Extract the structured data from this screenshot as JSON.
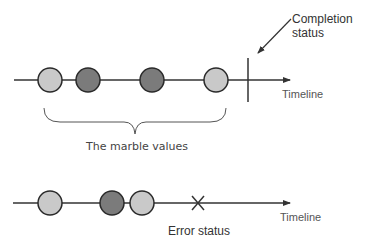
{
  "diagram": {
    "colors": {
      "line": "#333333",
      "marble_light": "#c9c9c9",
      "marble_dark": "#7b7b7b",
      "marble_stroke": "#2a2a2a"
    },
    "top_timeline": {
      "label": "Timeline",
      "marbles": [
        {
          "x": 50,
          "shade": "light"
        },
        {
          "x": 88,
          "shade": "dark"
        },
        {
          "x": 152,
          "shade": "dark"
        },
        {
          "x": 216,
          "shade": "light"
        }
      ],
      "terminator": "completion",
      "completion_label_line1": "Completion",
      "completion_label_line2": "status",
      "brace_label": "The marble values"
    },
    "bottom_timeline": {
      "label": "Timeline",
      "marbles": [
        {
          "x": 50,
          "shade": "light"
        },
        {
          "x": 112,
          "shade": "dark"
        },
        {
          "x": 142,
          "shade": "light"
        }
      ],
      "terminator": "error",
      "error_label": "Error status"
    }
  }
}
